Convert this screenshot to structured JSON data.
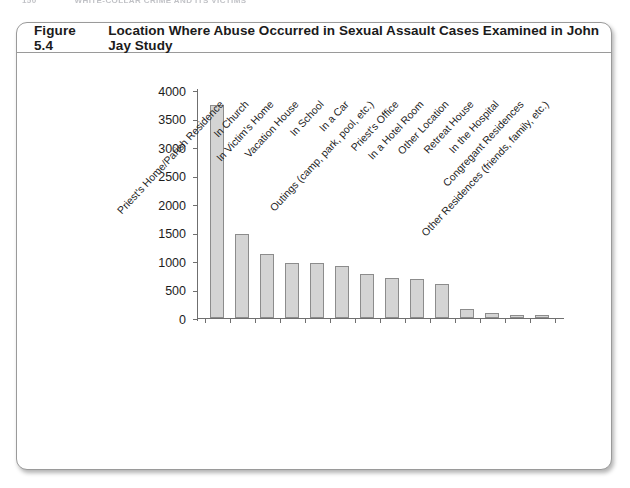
{
  "running_head": {
    "folio": "150",
    "text": "WHITE-COLLAR CRIME AND ITS VICTIMS"
  },
  "figure": {
    "number": "Figure 5.4",
    "title": "Location Where Abuse Occurred in Sexual Assault Cases Examined in John Jay Study"
  },
  "chart_data": {
    "type": "bar",
    "title": "Location Where Abuse Occurred in Sexual Assault Cases Examined in John Jay Study",
    "xlabel": "",
    "ylabel": "",
    "ylim": [
      0,
      4000
    ],
    "ytick_labels": [
      "0",
      "500",
      "1000",
      "1500",
      "2000",
      "2500",
      "3000",
      "3500",
      "4000"
    ],
    "yticks": [
      0,
      500,
      1000,
      1500,
      2000,
      2500,
      3000,
      3500,
      4000
    ],
    "grid": false,
    "legend": null,
    "categories": [
      "Priest's Home/Parish Residence",
      "In Church",
      "In Victim's Home",
      "Vacation House",
      "In School",
      "In a Car",
      "Outings (camp, park, pool, etc.)",
      "Priest's Office",
      "In a Hotel Room",
      "Other Location",
      "Retreat House",
      "In the Hospital",
      "Congregant Residences",
      "Other Residences (friends, family, etc.)"
    ],
    "values": [
      3740,
      1470,
      1120,
      960,
      965,
      905,
      780,
      705,
      690,
      595,
      150,
      90,
      55,
      60
    ],
    "bar_color": "#d4d4d4",
    "bar_edge_color": "#8c8c8c"
  }
}
